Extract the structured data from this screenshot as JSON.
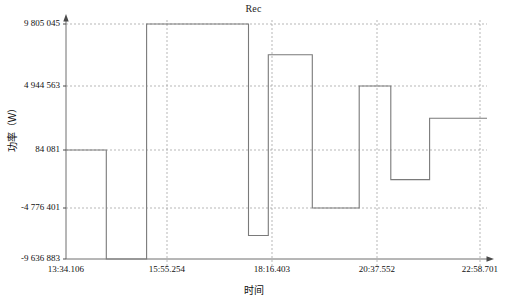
{
  "chart_data": {
    "type": "line",
    "title": "Rec",
    "xlabel": "时间",
    "ylabel": "功率（W）",
    "grid": true,
    "legend": "none",
    "step_style": "hv",
    "ylim": [
      -9636883,
      9805045
    ],
    "ytick_labels": [
      "9 805 045",
      "4 944 563",
      "84 081",
      "-4 776 401",
      "-9 636 883"
    ],
    "ytick_values": [
      9805045,
      4944563,
      84081,
      -4776401,
      -9636883
    ],
    "xtick_labels": [
      "13:34.106",
      "15:55.254",
      "18:16.403",
      "20:37.552",
      "22:58.701"
    ],
    "series": [
      {
        "name": "Rec",
        "color": "#7a7a7a",
        "x": [
          "13:34.106",
          "14:29.0",
          "15:24.0",
          "17:43.0",
          "18:10.0",
          "19:10.0",
          "20:14.0",
          "20:57.0",
          "21:50.0",
          "22:58.701"
        ],
        "values": [
          84081,
          -9636883,
          9805045,
          -7400000,
          7400000,
          -4776401,
          4944563,
          -2400000,
          2500000,
          2500000
        ],
        "segments": [
          {
            "from": "13:34.106",
            "to": "14:29.0",
            "value": 84081
          },
          {
            "from": "14:29.0",
            "to": "15:24.0",
            "value": -9636883
          },
          {
            "from": "15:24.0",
            "to": "17:43.0",
            "value": 9805045
          },
          {
            "from": "17:43.0",
            "to": "18:10.0",
            "value": -7400000
          },
          {
            "from": "18:10.0",
            "to": "19:10.0",
            "value": 7400000
          },
          {
            "from": "19:10.0",
            "to": "20:14.0",
            "value": -4776401
          },
          {
            "from": "20:14.0",
            "to": "20:57.0",
            "value": 4944563
          },
          {
            "from": "20:57.0",
            "to": "21:50.0",
            "value": -2400000
          },
          {
            "from": "21:50.0",
            "to": "22:58.701",
            "value": 2500000
          }
        ]
      }
    ]
  }
}
